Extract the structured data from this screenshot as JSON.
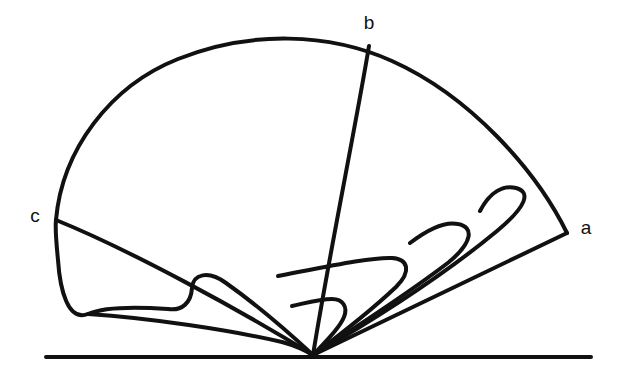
{
  "figure": {
    "type": "line-diagram",
    "title": "",
    "background_color": "#ffffff",
    "ink_color": "#111111",
    "canvas": {
      "width": 620,
      "height": 384
    },
    "labels": [
      {
        "id": "label-b",
        "text": "b",
        "x": 369,
        "y": 24,
        "anchor": "middle"
      },
      {
        "id": "label-c",
        "text": "c",
        "x": 35,
        "y": 217,
        "anchor": "middle"
      },
      {
        "id": "label-a",
        "text": "a",
        "x": 586,
        "y": 229,
        "anchor": "middle"
      }
    ],
    "points": {
      "a": {
        "x": 567,
        "y": 233
      },
      "b": {
        "x": 369,
        "y": 46
      },
      "c": {
        "x": 56,
        "y": 220
      },
      "apex": {
        "x": 313,
        "y": 355
      }
    },
    "baseline": {
      "x1": 46,
      "y1": 357,
      "x2": 591,
      "y2": 357,
      "width": 4
    },
    "stroke_widths": {
      "outer_arc": 4,
      "ray": 4,
      "loop": 4,
      "baseline": 4
    },
    "strokes": [
      {
        "name": "outer-arc-c-to-b-to-a",
        "d": "M 56 220 C 62 150 110 86 178 59 C 250 30 330 33 392 61 C 470 96 536 170 567 233",
        "width": 4
      },
      {
        "name": "ray-b-to-apex",
        "d": "M 369 46 C 355 130 330 250 313 355",
        "width": 4
      },
      {
        "name": "ray-a-to-apex",
        "d": "M 567 233 L 313 355",
        "width": 4
      },
      {
        "name": "ray-c-to-apex",
        "d": "M 56 220 C 130 250 240 310 313 355",
        "width": 4
      },
      {
        "name": "outer-loop-largest",
        "d": "M 313 355 C 380 316 450 270 497 231 C 527 206 531 192 516 188 C 503 185 490 192 480 211",
        "width": 4
      },
      {
        "name": "loop-third",
        "d": "M 313 355 C 364 322 414 289 449 262 C 473 242 474 227 458 224 C 444 221 427 230 410 243",
        "width": 4
      },
      {
        "name": "loop-second",
        "d": "M 313 355 C 349 328 378 304 396 287 C 412 271 408 259 392 258 C 372 257 330 266 278 276",
        "width": 4
      },
      {
        "name": "loop-first-outer-left",
        "d": "M 313 355 C 286 330 250 300 226 283 C 208 270 193 274 192 288 C 191 303 182 311 168 309",
        "width": 4
      },
      {
        "name": "loop-big-left-sweep",
        "d": "M 168 309 C 140 307 106 306 88 314 C 68 322 60 290 58 260 C 56 240 55 228 56 220",
        "width": 4
      },
      {
        "name": "loop-innermost",
        "d": "M 313 355 C 328 339 340 327 344 317 C 348 307 343 299 332 299 C 320 299 306 303 292 306",
        "width": 4
      },
      {
        "name": "loop-lower-band",
        "d": "M 88 314 C 150 318 230 330 282 342 C 300 347 308 352 313 355",
        "width": 4
      }
    ]
  }
}
